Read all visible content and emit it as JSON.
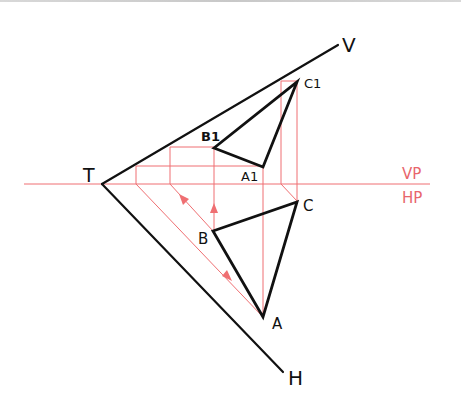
{
  "diagram": {
    "colors": {
      "ink": "#111111",
      "construction": "#ef6f72",
      "plane_label": "#e8666c"
    },
    "reference_line": {
      "upper_label": "VP",
      "lower_label": "HP"
    },
    "traces": {
      "vertex_label": "T",
      "vertical_trace_label": "V",
      "horizontal_trace_label": "H"
    },
    "elevation": {
      "points": [
        "A1",
        "B1",
        "C1"
      ],
      "labels": {
        "a": "A1",
        "b": "B1",
        "c": "C1"
      }
    },
    "plan": {
      "points": [
        "A",
        "B",
        "C"
      ],
      "labels": {
        "a": "A",
        "b": "B",
        "c": "C"
      }
    }
  }
}
